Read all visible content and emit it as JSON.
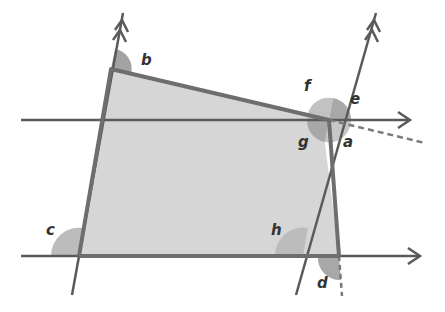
{
  "diagram": {
    "type": "geometry-angles-parallel-lines",
    "labels": {
      "a": "a",
      "b": "b",
      "c": "c",
      "d": "d",
      "e": "e",
      "f": "f",
      "g": "g",
      "h": "h"
    },
    "colors": {
      "line": "#5a5a5a",
      "quad_fill": "#d6d6d6",
      "quad_edge": "#6e6e6e",
      "angle_light": "#b9b9b9",
      "angle_dark": "#9a9a9a",
      "background": "#ffffff"
    }
  }
}
